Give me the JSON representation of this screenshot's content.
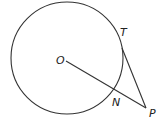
{
  "diagram": {
    "labels": {
      "center": "O",
      "tangent_point": "T",
      "intersection_point": "N",
      "external_point": "P"
    },
    "colors": {
      "line": "#333333",
      "text": "#222222",
      "background": "#ffffff"
    }
  }
}
